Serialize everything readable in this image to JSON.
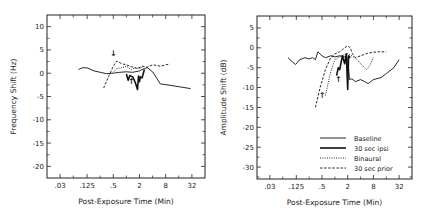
{
  "chart_data": [
    {
      "type": "line",
      "title": "",
      "xlabel": "Post-Exposure Time (Min)",
      "ylabel": "Frequency Shift (Hz)",
      "xscale": "log2",
      "xticks": [
        0.03,
        0.125,
        0.5,
        2,
        8,
        32
      ],
      "xtick_labels": [
        ".03",
        ".125",
        ".5",
        "2",
        "8",
        "32"
      ],
      "xlim": [
        0.015,
        64
      ],
      "yticks": [
        10,
        5,
        0,
        -5,
        -10,
        -15,
        -20
      ],
      "ytick_labels": [
        "10",
        "5",
        "0",
        "-5",
        "-10",
        "-15",
        "-20"
      ],
      "ylim": [
        -22.5,
        12.5
      ],
      "grid": false,
      "legend": null,
      "annotations": [
        {
          "text": "↓",
          "x": 0.5,
          "y": 3.8
        },
        {
          "text": "↑",
          "x": 1.3,
          "y": -2.3
        }
      ],
      "series": [
        {
          "name": "Baseline",
          "style": "solid",
          "x": [
            0.08,
            0.1,
            0.13,
            0.18,
            0.25,
            0.35,
            0.5,
            0.7,
            1.0,
            1.4,
            2.0,
            2.6,
            3.0,
            4.0,
            6.0,
            10,
            16,
            30
          ],
          "y": [
            0.8,
            1.2,
            1.1,
            0.5,
            0.2,
            -0.1,
            0,
            0.2,
            0.3,
            0.2,
            0.5,
            1.0,
            1.2,
            0.3,
            -2.3,
            -2.6,
            -2.9,
            -3.3
          ]
        },
        {
          "name": "30 sec ipsi",
          "style": "heavy",
          "x": [
            1.0,
            1.1,
            1.2,
            1.4,
            1.6,
            1.8,
            1.9,
            2.0,
            2.1,
            2.3,
            2.6
          ],
          "y": [
            -0.2,
            -1.5,
            -0.5,
            -0.8,
            -2.0,
            -3.5,
            -0.6,
            -1.8,
            -0.8,
            -1.0,
            0.8
          ]
        },
        {
          "name": "Binaural",
          "style": "dotted",
          "x": [
            0.5,
            0.6,
            0.8,
            1.0,
            1.3,
            1.6,
            2.0,
            2.5
          ],
          "y": [
            0.2,
            1.0,
            1.2,
            1.5,
            0.8,
            1.2,
            1.0,
            1.5
          ]
        },
        {
          "name": "30 sec prior",
          "style": "dashed",
          "x": [
            0.3,
            0.4,
            0.5,
            0.6,
            0.8,
            1.0,
            1.3,
            1.8,
            2.3,
            3.0,
            4.0,
            6.0,
            10
          ],
          "y": [
            -3.2,
            -0.5,
            1.5,
            2.6,
            2.0,
            1.8,
            1.4,
            1.0,
            1.5,
            1.3,
            1.8,
            1.5,
            2.0
          ]
        }
      ]
    },
    {
      "type": "line",
      "title": "",
      "xlabel": "Post-Exposure Time (Min)",
      "ylabel": "Amplitude Shift (dB)",
      "xscale": "log2",
      "xticks": [
        0.03,
        0.125,
        0.5,
        2,
        8,
        32
      ],
      "xtick_labels": [
        ".03",
        ".125",
        ".5",
        "2",
        "8",
        "32"
      ],
      "xlim": [
        0.015,
        64
      ],
      "yticks": [
        5,
        0,
        -5,
        -10,
        -15,
        -20,
        -25,
        -30
      ],
      "ytick_labels": [
        "5",
        "0",
        "-5",
        "-10",
        "-15",
        "-20",
        "-25",
        "-30"
      ],
      "ylim": [
        -33,
        8
      ],
      "grid": false,
      "legend": {
        "position": "bottom-right",
        "entries": [
          "Baseline",
          "30 sec ipsi",
          "Binaural",
          "30 sec prior"
        ]
      },
      "annotations": [
        {
          "text": "↑",
          "x": 0.5,
          "y": -12.5
        },
        {
          "text": "↑",
          "x": 1.2,
          "y": -8.5
        }
      ],
      "series": [
        {
          "name": "Baseline",
          "style": "solid",
          "x": [
            0.08,
            0.1,
            0.12,
            0.15,
            0.2,
            0.25,
            0.3,
            0.35,
            0.4,
            0.5,
            0.6,
            0.8,
            1.0,
            1.3,
            1.7,
            2.0,
            2.2,
            2.5,
            3.0,
            4.0,
            5.0,
            6.0,
            8.0,
            12,
            16,
            24,
            32
          ],
          "y": [
            -2.5,
            -3.5,
            -4.2,
            -3.0,
            -2.5,
            -2.8,
            -2.5,
            -3.0,
            -1.0,
            -2.0,
            -2.5,
            -2.0,
            -2.3,
            -2.0,
            -2.3,
            -2.5,
            -8.0,
            -7.8,
            -8.5,
            -8.0,
            -8.5,
            -9.0,
            -8.0,
            -7.5,
            -6.5,
            -5.0,
            -3.0
          ]
        },
        {
          "name": "30 sec ipsi",
          "style": "heavy",
          "x": [
            1.1,
            1.2,
            1.3,
            1.5,
            1.7,
            1.85,
            2.0,
            2.1,
            2.3
          ],
          "y": [
            -7.0,
            -5.0,
            -5.5,
            -2.0,
            -4.0,
            -1.5,
            -10.5,
            -2.0,
            -2.5
          ]
        },
        {
          "name": "Binaural",
          "style": "dotted",
          "x": [
            0.6,
            0.8,
            1.0,
            1.4,
            2.0,
            3.0,
            4.0,
            5.5,
            6.5,
            8.0
          ],
          "y": [
            -12.0,
            -6.0,
            -3.0,
            -2.0,
            -1.5,
            -2.5,
            -4.0,
            -5.5,
            -4.5,
            -2.5
          ]
        },
        {
          "name": "30 sec prior",
          "style": "dashed",
          "x": [
            0.35,
            0.45,
            0.6,
            0.8,
            1.0,
            1.3,
            1.6,
            2.0,
            2.3,
            2.6,
            3.0,
            4.0,
            6.0,
            10,
            16
          ],
          "y": [
            -15.0,
            -10.0,
            -5.5,
            -2.5,
            -1.5,
            -1.0,
            -0.2,
            0.5,
            0.0,
            -1.5,
            -2.5,
            -2.0,
            -1.3,
            -1.0,
            -1.0
          ]
        }
      ]
    }
  ]
}
